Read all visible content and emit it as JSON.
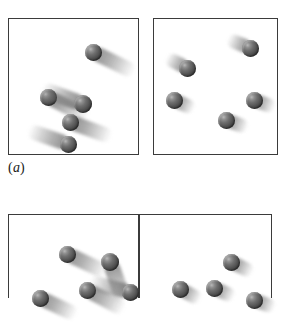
{
  "figure": {
    "width": 286,
    "height": 296,
    "background_color": "#ffffff",
    "border_color": "#3b3b3b",
    "ball_color_dark": "#333333",
    "ball_color_light": "#b9b9b9",
    "trail_color": "#787878"
  },
  "captions": [
    {
      "id": "caption-a",
      "open": "(",
      "letter": "a",
      "close": ")",
      "text": "(a)",
      "x": 8,
      "y": 160
    }
  ],
  "panels": [
    {
      "id": "panel-a-left",
      "name": "panel-a-left",
      "row": "a",
      "side": "left",
      "x": 8,
      "y": 18,
      "width": 131,
      "height": 137,
      "particle_count": 5,
      "speed_class": "fast",
      "particles": [
        {
          "cx": 93,
          "cy": 52,
          "r": 8.5,
          "angle": 206,
          "trail_length": 46,
          "trail_width": 15
        },
        {
          "cx": 48,
          "cy": 97,
          "r": 8.5,
          "angle": 207,
          "trail_length": 45,
          "trail_width": 15
        },
        {
          "cx": 83,
          "cy": 104,
          "r": 9.0,
          "angle": 20,
          "trail_length": 44,
          "trail_width": 16
        },
        {
          "cx": 70,
          "cy": 122,
          "r": 8.5,
          "angle": 200,
          "trail_length": 44,
          "trail_width": 15
        },
        {
          "cx": 68,
          "cy": 144,
          "r": 8.5,
          "angle": 19,
          "trail_length": 42,
          "trail_width": 15
        }
      ]
    },
    {
      "id": "panel-a-right",
      "name": "panel-a-right",
      "row": "a",
      "side": "right",
      "x": 153,
      "y": 18,
      "width": 125,
      "height": 137,
      "particle_count": 5,
      "speed_class": "slow",
      "particles": [
        {
          "cx": 250,
          "cy": 48,
          "r": 8.5,
          "angle": 22,
          "trail_length": 24,
          "trail_width": 14
        },
        {
          "cx": 187,
          "cy": 68,
          "r": 8.5,
          "angle": 27,
          "trail_length": 23,
          "trail_width": 14
        },
        {
          "cx": 174,
          "cy": 100,
          "r": 8.5,
          "angle": 204,
          "trail_length": 22,
          "trail_width": 14
        },
        {
          "cx": 254,
          "cy": 100,
          "r": 8.5,
          "angle": 200,
          "trail_length": 22,
          "trail_width": 14
        },
        {
          "cx": 226,
          "cy": 120,
          "r": 8.5,
          "angle": 200,
          "trail_length": 23,
          "trail_width": 14
        }
      ]
    },
    {
      "id": "panel-b-left",
      "name": "panel-b-left",
      "row": "b",
      "side": "left",
      "x": 8,
      "y": 214,
      "width": 130,
      "height": 84,
      "particle_count": 5,
      "speed_class": "fast",
      "particles": [
        {
          "cx": 67,
          "cy": 254,
          "r": 8.5,
          "angle": 205,
          "trail_length": 44,
          "trail_width": 15
        },
        {
          "cx": 110,
          "cy": 262,
          "r": 9.0,
          "angle": 250,
          "trail_length": 42,
          "trail_width": 16
        },
        {
          "cx": 87,
          "cy": 290,
          "r": 8.5,
          "angle": 208,
          "trail_length": 42,
          "trail_width": 15
        },
        {
          "cx": 40,
          "cy": 298,
          "r": 8.5,
          "angle": 205,
          "trail_length": 40,
          "trail_width": 15
        },
        {
          "cx": 130,
          "cy": 292,
          "r": 8.5,
          "angle": 14,
          "trail_length": 42,
          "trail_width": 15
        }
      ]
    },
    {
      "id": "panel-b-right",
      "name": "panel-b-right",
      "row": "b",
      "side": "right",
      "x": 138,
      "y": 214,
      "width": 134,
      "height": 84,
      "particle_count": 4,
      "speed_class": "slow",
      "particles": [
        {
          "cx": 231,
          "cy": 262,
          "r": 8.5,
          "angle": 206,
          "trail_length": 24,
          "trail_width": 14
        },
        {
          "cx": 180,
          "cy": 289,
          "r": 8.5,
          "angle": 208,
          "trail_length": 23,
          "trail_width": 14
        },
        {
          "cx": 214,
          "cy": 288,
          "r": 8.5,
          "angle": 204,
          "trail_length": 22,
          "trail_width": 14
        },
        {
          "cx": 254,
          "cy": 300,
          "r": 8.5,
          "angle": 200,
          "trail_length": 22,
          "trail_width": 14
        }
      ]
    }
  ],
  "dividers": [
    {
      "id": "divider-row-b",
      "x": 138,
      "y": 214,
      "height": 84
    }
  ]
}
